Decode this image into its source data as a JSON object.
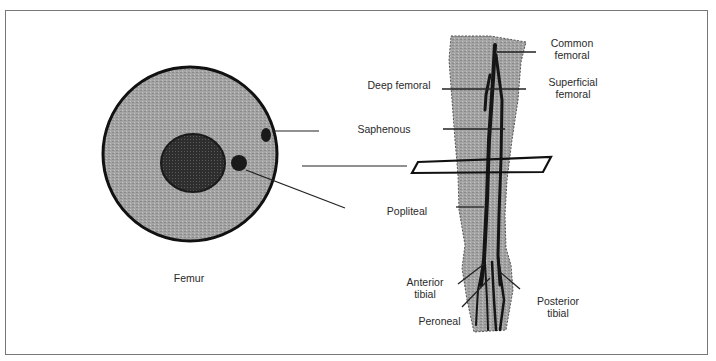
{
  "diagram": {
    "type": "anatomical cross-section and longitudinal leg vessels",
    "cross_section": {
      "label": "Femur",
      "structures": [
        "thigh cross-section",
        "femur bone",
        "saphenous vein",
        "popliteal vessel"
      ]
    },
    "leg": {
      "labels": {
        "common_femoral": "Common\nfemoral",
        "superficial_femoral": "Superficial\nfemoral",
        "deep_femoral": "Deep femoral",
        "saphenous": "Saphenous",
        "popliteal": "Popliteal",
        "anterior_tibial": "Anterior\ntibial",
        "posterior_tibial": "Posterior\ntibial",
        "peroneal": "Peroneal"
      }
    },
    "colors": {
      "tissue": "#9a9a9a",
      "bone": "#2e2e2e",
      "vessel": "#1a1a1a",
      "outline": "#111111",
      "frame": "#777777"
    }
  }
}
